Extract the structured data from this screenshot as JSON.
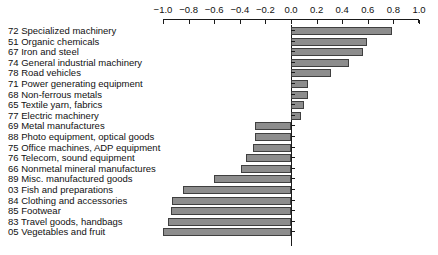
{
  "chart_data": {
    "type": "bar",
    "orientation": "horizontal",
    "title": "",
    "subtitle": "",
    "xlabel": "",
    "ylabel": "",
    "xlim": [
      -1.0,
      1.0
    ],
    "xtick_labels": [
      "-1.0",
      "-0.8",
      "-0.6",
      "-0.4",
      "-0.2",
      "0.0",
      "0.2",
      "0.4",
      "0.6",
      "0.8",
      "1.0"
    ],
    "xtick_values": [
      -1.0,
      -0.8,
      -0.6,
      -0.4,
      -0.2,
      0.0,
      0.2,
      0.4,
      0.6,
      0.8,
      1.0
    ],
    "grid": false,
    "legend": null,
    "axis_position": "top",
    "bar_fill": "#8d8d8d",
    "bar_stroke": "#3f3f3f",
    "categories": [
      "72 Specialized machinery",
      "51 Organic chemicals",
      "67 Iron and steel",
      "74 General industrial machinery",
      "78 Road vehicles",
      "71 Power generating equipment",
      "68 Non-ferrous metals",
      "65 Textile yarn, fabrics",
      "77 Electric machinery",
      "69 Metal manufactures",
      "88 Photo equipment, optical goods",
      "75 Office machines, ADP equipment",
      "76 Telecom, sound equipment",
      "66 Nonmetal mineral manufactures",
      "89 Misc. manufactured goods",
      "03 Fish and preparations",
      "84 Clothing and accessories",
      "85 Footwear",
      "83 Travel goods, handbags",
      "05 Vegetables and fruit"
    ],
    "values": [
      0.79,
      0.59,
      0.56,
      0.45,
      0.31,
      0.13,
      0.13,
      0.1,
      0.08,
      -0.28,
      -0.28,
      -0.3,
      -0.35,
      -0.39,
      -0.6,
      -0.84,
      -0.93,
      -0.94,
      -0.96,
      -1.0
    ]
  }
}
